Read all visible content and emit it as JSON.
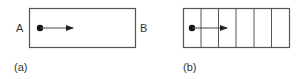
{
  "panels": [
    {
      "id": "a",
      "caption": "(a)",
      "left_label": "A",
      "right_label": "B",
      "box": {
        "x": 29,
        "y": 8,
        "width": 106,
        "height": 39
      },
      "cells": 1,
      "dot": {
        "cx": 40,
        "cy": 28,
        "r": 3.2
      },
      "arrow": {
        "x1": 40,
        "x2": 73,
        "y": 28
      }
    },
    {
      "id": "b",
      "caption": "(b)",
      "box": {
        "x": 183,
        "y": 8,
        "width": 106,
        "height": 39
      },
      "cells": 6,
      "dot": {
        "cx": 192,
        "cy": 28,
        "r": 3.2
      },
      "arrow": {
        "x1": 192,
        "x2": 227,
        "y": 28
      }
    }
  ],
  "colors": {
    "stroke": "#555555",
    "dot": "#111111",
    "text": "#333333"
  }
}
